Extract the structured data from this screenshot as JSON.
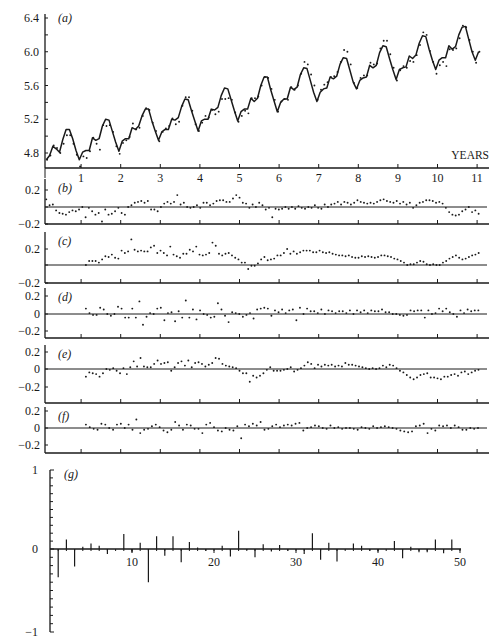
{
  "chart_data": [
    {
      "panel": "a",
      "type": "line",
      "label": "(a)",
      "xlabel": "YEARS",
      "ylabel": "",
      "xlim": [
        0,
        11.2
      ],
      "ylim": [
        4.65,
        6.45
      ],
      "xticks": [
        1,
        2,
        3,
        4,
        5,
        6,
        7,
        8,
        9,
        10,
        11
      ],
      "yticks": [
        4.8,
        5.2,
        5.6,
        6.0,
        6.4
      ],
      "ytick_labels": [
        "4.8",
        "5.2",
        "5.6",
        "6.0",
        "6.4"
      ],
      "grid": false,
      "series": [
        {
          "name": "fitted",
          "style": "line",
          "values": [
            4.72,
            4.77,
            4.88,
            4.85,
            4.81,
            4.96,
            5.08,
            5.08,
            4.97,
            4.83,
            4.72,
            4.81,
            4.83,
            4.83,
            4.98,
            4.95,
            4.97,
            5.12,
            5.2,
            5.19,
            5.06,
            4.93,
            4.82,
            4.94,
            4.97,
            4.97,
            5.1,
            5.08,
            5.12,
            5.24,
            5.32,
            5.32,
            5.18,
            5.06,
            4.95,
            5.05,
            5.08,
            5.08,
            5.2,
            5.19,
            5.22,
            5.35,
            5.44,
            5.43,
            5.3,
            5.18,
            5.06,
            5.18,
            5.2,
            5.2,
            5.32,
            5.31,
            5.34,
            5.48,
            5.57,
            5.56,
            5.43,
            5.3,
            5.18,
            5.29,
            5.32,
            5.32,
            5.45,
            5.41,
            5.45,
            5.6,
            5.7,
            5.7,
            5.55,
            5.42,
            5.29,
            5.4,
            5.44,
            5.44,
            5.58,
            5.55,
            5.58,
            5.73,
            5.81,
            5.8,
            5.66,
            5.52,
            5.41,
            5.52,
            5.56,
            5.57,
            5.7,
            5.68,
            5.71,
            5.85,
            5.93,
            5.92,
            5.78,
            5.64,
            5.56,
            5.66,
            5.69,
            5.7,
            5.84,
            5.81,
            5.84,
            5.99,
            6.07,
            6.06,
            5.92,
            5.79,
            5.67,
            5.79,
            5.81,
            5.82,
            5.95,
            5.92,
            5.96,
            6.1,
            6.19,
            6.18,
            6.03,
            5.9,
            5.79,
            5.9,
            5.93,
            5.93,
            6.07,
            6.03,
            6.06,
            6.2,
            6.29,
            6.3,
            6.15,
            6.0,
            5.9,
            6.0
          ]
        },
        {
          "name": "observed",
          "style": "dots",
          "values": [
            4.72,
            4.77,
            4.89,
            4.86,
            4.8,
            4.91,
            5.01,
            5.01,
            4.91,
            4.78,
            4.64,
            4.76,
            4.74,
            4.82,
            4.98,
            4.91,
            4.84,
            5.13,
            5.12,
            5.13,
            5.05,
            4.88,
            4.79,
            4.92,
            4.95,
            4.99,
            5.15,
            5.08,
            5.1,
            5.24,
            5.33,
            5.31,
            5.16,
            5.06,
            4.94,
            5.05,
            5.09,
            5.12,
            5.21,
            5.14,
            5.17,
            5.36,
            5.46,
            5.46,
            5.3,
            5.14,
            5.06,
            5.16,
            5.24,
            5.22,
            5.31,
            5.26,
            5.29,
            5.44,
            5.44,
            5.45,
            5.43,
            5.28,
            5.17,
            5.24,
            5.3,
            5.27,
            5.45,
            5.45,
            5.47,
            5.6,
            5.7,
            5.69,
            5.56,
            5.43,
            5.29,
            5.41,
            5.44,
            5.43,
            5.58,
            5.55,
            5.6,
            5.74,
            5.88,
            5.85,
            5.73,
            5.6,
            5.43,
            5.55,
            5.61,
            5.64,
            5.7,
            5.71,
            5.76,
            5.88,
            6.02,
            6.0,
            5.85,
            5.63,
            5.57,
            5.69,
            5.72,
            5.72,
            5.87,
            5.85,
            5.86,
            6.04,
            6.13,
            6.13,
            5.97,
            5.81,
            5.66,
            5.78,
            5.83,
            5.81,
            5.89,
            5.88,
            5.96,
            6.08,
            6.23,
            6.2,
            6.01,
            5.88,
            5.74,
            5.84,
            5.88,
            5.83,
            6.03,
            6.02,
            6.04,
            6.16,
            6.31,
            6.29,
            6.14,
            6.0,
            5.87,
            6.0
          ]
        }
      ]
    },
    {
      "panel": "b",
      "type": "scatter",
      "label": "(b)",
      "ylim": [
        -0.2,
        0.2
      ],
      "yticks": [
        0.2,
        -0.2
      ],
      "ytick_labels": [
        "0.2",
        "−0.2"
      ],
      "zero_line": true,
      "values": [
        0.09,
        0.02,
        0.03,
        -0.04,
        -0.07,
        -0.08,
        -0.09,
        -0.06,
        -0.04,
        -0.05,
        -0.03,
        0.0,
        -0.12,
        -0.01,
        -0.05,
        -0.09,
        -0.07,
        -0.17,
        -0.03,
        -0.09,
        -0.08,
        -0.05,
        -0.01,
        -0.07,
        -0.09,
        0.0,
        0.02,
        0.05,
        0.06,
        0.07,
        0.05,
        0.07,
        -0.03,
        -0.03,
        -0.05,
        0.0,
        0.04,
        0.06,
        0.04,
        0.06,
        0.14,
        0.03,
        0.05,
        0.0,
        -0.01,
        0.0,
        0.02,
        -0.01,
        0.05,
        0.05,
        0.02,
        0.04,
        0.07,
        0.08,
        0.08,
        0.06,
        0.06,
        0.1,
        0.14,
        0.11,
        0.05,
        0.04,
        -0.01,
        0.03,
        0.0,
        0.05,
        0.02,
        -0.03,
        -0.01,
        -0.12,
        -0.02,
        -0.03,
        -0.02,
        0.0,
        -0.02,
        0.0,
        -0.02,
        0.01,
        -0.01,
        -0.02,
        0.0,
        -0.01,
        0.02,
        -0.01,
        -0.02,
        0.03,
        0.0,
        0.03,
        0.04,
        0.06,
        0.03,
        0.06,
        0.05,
        0.03,
        0.05,
        0.08,
        0.06,
        0.05,
        0.04,
        0.05,
        0.04,
        0.06,
        0.08,
        0.09,
        0.07,
        0.06,
        0.05,
        0.07,
        0.04,
        0.06,
        0.03,
        0.05,
        -0.01,
        0.02,
        0.05,
        0.06,
        0.08,
        0.08,
        0.07,
        0.05,
        0.06,
        0.04,
        -0.01,
        -0.06,
        -0.09,
        -0.1,
        -0.09,
        -0.05,
        -0.03,
        0.0,
        -0.06,
        -0.04,
        -0.08
      ]
    },
    {
      "panel": "c",
      "type": "scatter",
      "label": "(c)",
      "ylim": [
        -0.2,
        0.3
      ],
      "yticks": [
        0.2,
        -0.2
      ],
      "ytick_labels": [
        "0.2",
        "−0.2"
      ],
      "zero_line": true,
      "values": [
        0.0,
        0.05,
        0.05,
        0.05,
        0.03,
        0.07,
        0.11,
        0.1,
        0.13,
        0.09,
        0.08,
        0.18,
        0.15,
        0.17,
        0.32,
        0.19,
        0.17,
        0.18,
        0.17,
        0.17,
        0.22,
        0.24,
        0.15,
        0.18,
        0.15,
        0.12,
        0.23,
        0.13,
        0.11,
        0.09,
        0.14,
        0.14,
        0.19,
        0.17,
        0.23,
        0.13,
        0.12,
        0.13,
        0.15,
        0.28,
        0.24,
        0.14,
        0.12,
        0.14,
        0.15,
        0.12,
        0.09,
        0.07,
        0.03,
        0.03,
        -0.05,
        -0.01,
        -0.01,
        0.02,
        0.07,
        0.1,
        0.06,
        0.07,
        0.08,
        0.12,
        0.12,
        0.15,
        0.2,
        0.14,
        0.17,
        0.14,
        0.16,
        0.18,
        0.18,
        0.18,
        0.16,
        0.16,
        0.18,
        0.16,
        0.15,
        0.16,
        0.14,
        0.13,
        0.12,
        0.12,
        0.11,
        0.12,
        0.1,
        0.09,
        0.09,
        0.11,
        0.1,
        0.11,
        0.1,
        0.09,
        0.1,
        0.12,
        0.12,
        0.11,
        0.1,
        0.08,
        0.07,
        0.05,
        0.03,
        0.0,
        0.01,
        0.01,
        0.03,
        0.05,
        0.04,
        0.01,
        0.0,
        0.01,
        0.0,
        0.0,
        0.03,
        0.05,
        0.08,
        0.1,
        0.12,
        0.09,
        0.07,
        0.08,
        0.1,
        0.12,
        0.13,
        0.15
      ]
    },
    {
      "panel": "d",
      "type": "scatter",
      "label": "(d)",
      "ylim": [
        -0.27,
        0.27
      ],
      "yticks": [
        0.2,
        0,
        -0.2
      ],
      "ytick_labels": [
        "0.2",
        "0",
        "−0.2"
      ],
      "zero_line": true,
      "values": [
        0.06,
        0.01,
        -0.01,
        -0.01,
        0.07,
        0.05,
        0.0,
        -0.02,
        0.0,
        0.08,
        0.06,
        -0.04,
        -0.04,
        0.06,
        -0.04,
        0.14,
        -0.12,
        -0.03,
        0.01,
        0.0,
        0.06,
        0.07,
        -0.07,
        0.01,
        0.02,
        -0.08,
        0.03,
        -0.04,
        0.15,
        -0.04,
        0.05,
        -0.06,
        0.04,
        0.0,
        -0.01,
        -0.04,
        -0.03,
        0.12,
        0.05,
        -0.02,
        -0.09,
        0.02,
        0.01,
        0.0,
        -0.03,
        -0.01,
        0.01,
        -0.05,
        0.05,
        0.06,
        0.07,
        0.06,
        -0.02,
        0.04,
        0.02,
        0.05,
        0.01,
        0.04,
        0.05,
        -0.07,
        0.07,
        0.0,
        0.06,
        0.03,
        0.03,
        0.01,
        0.05,
        0.0,
        0.04,
        0.03,
        0.01,
        0.03,
        0.03,
        0.01,
        0.04,
        0.0,
        0.04,
        0.02,
        0.04,
        0.01,
        0.04,
        0.03,
        0.03,
        0.05,
        0.02,
        0.02,
        0.0,
        0.0,
        -0.01,
        -0.02,
        -0.01,
        0.04,
        0.03,
        0.04,
        0.04,
        -0.04,
        0.04,
        0.0,
        0.01,
        0.06,
        0.03,
        0.06,
        0.02,
        0.0,
        -0.03,
        0.04,
        0.01,
        0.05,
        0.03,
        0.04,
        0.04
      ]
    },
    {
      "panel": "e",
      "type": "scatter",
      "label": "(e)",
      "ylim": [
        -0.3,
        0.27
      ],
      "yticks": [
        0.2,
        0,
        -0.2
      ],
      "ytick_labels": [
        "0.2",
        "0",
        "−0.2"
      ],
      "zero_line": true,
      "values": [
        -0.09,
        -0.04,
        -0.05,
        -0.06,
        -0.09,
        -0.05,
        0.0,
        -0.01,
        0.01,
        -0.02,
        -0.05,
        0.01,
        -0.06,
        0.02,
        0.09,
        0.03,
        0.13,
        0.03,
        0.02,
        0.02,
        0.06,
        0.1,
        0.06,
        0.07,
        0.08,
        -0.02,
        0.02,
        0.07,
        0.09,
        0.04,
        0.1,
        0.02,
        0.07,
        0.08,
        0.06,
        0.03,
        0.05,
        0.07,
        0.13,
        0.12,
        0.06,
        0.04,
        0.03,
        0.02,
        0.01,
        -0.02,
        -0.05,
        -0.05,
        -0.15,
        -0.08,
        -0.1,
        -0.08,
        -0.05,
        -0.01,
        0.02,
        -0.02,
        -0.02,
        -0.02,
        -0.01,
        0.0,
        0.02,
        -0.03,
        -0.01,
        0.01,
        0.04,
        0.08,
        0.06,
        0.01,
        0.05,
        0.03,
        0.05,
        0.04,
        0.05,
        0.03,
        0.04,
        0.03,
        0.07,
        0.05,
        0.05,
        0.04,
        0.03,
        0.02,
        0.01,
        0.0,
        0.01,
        0.0,
        0.01,
        0.04,
        0.02,
        0.05,
        0.04,
        0.01,
        -0.02,
        -0.04,
        -0.07,
        -0.1,
        -0.12,
        -0.1,
        -0.07,
        -0.06,
        -0.05,
        -0.1,
        -0.1,
        -0.11,
        -0.12,
        -0.09,
        -0.09,
        -0.07,
        -0.06,
        -0.08,
        -0.04,
        -0.03,
        -0.06,
        -0.04,
        -0.02,
        -0.01
      ]
    },
    {
      "panel": "f",
      "type": "scatter",
      "label": "(f)",
      "ylim": [
        -0.3,
        0.25
      ],
      "yticks": [
        0.2,
        0,
        -0.2
      ],
      "ytick_labels": [
        "0.2",
        "0",
        "−0.2"
      ],
      "zero_line": true,
      "values": [
        0.04,
        0.01,
        -0.01,
        -0.02,
        0.05,
        0.04,
        0.0,
        -0.02,
        0.04,
        0.05,
        0.0,
        0.04,
        -0.02,
        0.1,
        -0.06,
        -0.02,
        -0.01,
        0.02,
        0.04,
        0.01,
        -0.03,
        -0.05,
        -0.02,
        0.07,
        0.03,
        -0.02,
        0.04,
        0.03,
        -0.01,
        -0.01,
        -0.06,
        0.04,
        0.06,
        0.01,
        -0.03,
        -0.04,
        0.0,
        -0.02,
        -0.03,
        0.02,
        -0.12,
        0.04,
        0.02,
        0.05,
        0.03,
        0.07,
        -0.02,
        -0.01,
        0.02,
        0.04,
        0.01,
        0.03,
        0.04,
        0.03,
        0.05,
        0.06,
        -0.03,
        0.0,
        0.01,
        0.03,
        0.02,
        0.0,
        -0.01,
        0.03,
        0.0,
        0.01,
        -0.01,
        0.0,
        0.0,
        -0.01,
        -0.02,
        0.01,
        0.0,
        -0.01,
        0.02,
        0.0,
        0.01,
        0.02,
        0.01,
        0.0,
        -0.01,
        -0.03,
        -0.04,
        -0.05,
        -0.04,
        0.02,
        0.03,
        0.05,
        -0.06,
        -0.01,
        -0.03,
        0.03,
        0.02,
        0.03,
        0.0,
        0.03,
        0.01,
        -0.02,
        -0.02,
        0.0,
        -0.01,
        0.0
      ]
    },
    {
      "panel": "g",
      "type": "bar",
      "label": "(g)",
      "xlim": [
        0,
        50
      ],
      "ylim": [
        -1,
        1
      ],
      "xticks": [
        10,
        20,
        30,
        40,
        50
      ],
      "xtick_labels": [
        "10",
        "20",
        "30",
        "40",
        "50"
      ],
      "yticks": [
        1,
        0,
        -1
      ],
      "ytick_labels": [
        "1",
        "0",
        "−1"
      ],
      "minor_yticks": 20,
      "categories": [
        1,
        2,
        3,
        4,
        5,
        6,
        7,
        8,
        9,
        10,
        11,
        12,
        13,
        14,
        15,
        16,
        17,
        18,
        19,
        20,
        21,
        22,
        23,
        24,
        25,
        26,
        27,
        28,
        29,
        30,
        31,
        32,
        33,
        34,
        35,
        36,
        37,
        38,
        39,
        40,
        41,
        42,
        43,
        44,
        45,
        46,
        47,
        48,
        49,
        50
      ],
      "values": [
        -0.34,
        0.12,
        -0.21,
        0.03,
        0.07,
        0.04,
        -0.06,
        0.0,
        0.19,
        -0.04,
        0.08,
        -0.4,
        0.16,
        -0.08,
        0.16,
        -0.16,
        0.09,
        0.02,
        -0.02,
        0.0,
        0.04,
        -0.09,
        0.23,
        -0.01,
        -0.1,
        0.06,
        -0.03,
        0.05,
        -0.02,
        0.0,
        -0.06,
        0.2,
        -0.13,
        0.08,
        -0.15,
        0.0,
        0.07,
        0.04,
        -0.02,
        -0.03,
        0.0,
        0.1,
        -0.11,
        0.03,
        -0.04,
        -0.04,
        0.12,
        -0.05,
        0.12,
        0.0
      ]
    }
  ]
}
